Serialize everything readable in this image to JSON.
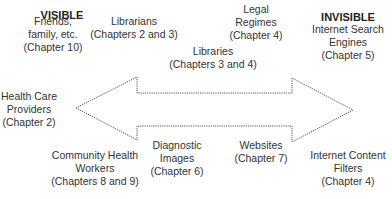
{
  "headers": {
    "left": "VISIBLE",
    "right": "INVISIBLE"
  },
  "arrow": {
    "style": "dotted double-headed arrow",
    "stroke_color": "#555555",
    "left_label_end": "VISIBLE",
    "right_label_end": "INVISIBLE"
  },
  "labels": [
    {
      "id": "friends",
      "text": "Friends,\nfamily, etc.\n(Chapter 10)",
      "x": 53,
      "y": 15
    },
    {
      "id": "librarians",
      "text": "Librarians\n(Chapters 2 and 3)",
      "x": 134,
      "y": 15
    },
    {
      "id": "legal-regimes",
      "text": "Legal\nRegimes\n(Chapter 4)",
      "x": 256,
      "y": 3
    },
    {
      "id": "libraries",
      "text": "Libraries\n(Chapters 3 and 4)",
      "x": 213,
      "y": 45
    },
    {
      "id": "search-engines",
      "text": "Internet Search\nEngines\n(Chapter 5)",
      "x": 348,
      "y": 23
    },
    {
      "id": "health-care",
      "text": "Health Care\nProviders\n(Chapter 2)",
      "x": 29,
      "y": 90
    },
    {
      "id": "community-health",
      "text": "Community Health\nWorkers\n(Chapters 8 and 9)",
      "x": 95,
      "y": 149
    },
    {
      "id": "diagnostic-images",
      "text": "Diagnostic\nImages\n(Chapter 6)",
      "x": 177,
      "y": 139
    },
    {
      "id": "websites",
      "text": "Websites\n(Chapter 7)",
      "x": 261,
      "y": 139
    },
    {
      "id": "content-filters",
      "text": "Internet Content\nFilters\n(Chapter 4)",
      "x": 348,
      "y": 149
    }
  ]
}
